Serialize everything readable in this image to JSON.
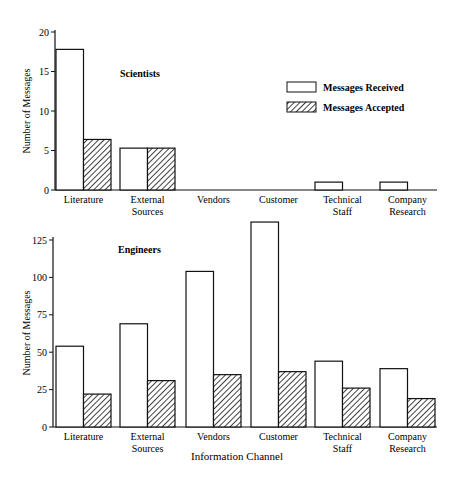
{
  "chart_data": [
    {
      "type": "bar",
      "title": "Scientists",
      "xlabel": "",
      "ylabel": "Number of Messages",
      "ylim": [
        0,
        20
      ],
      "yticks": [
        0,
        5,
        10,
        15,
        20
      ],
      "categories": [
        "Literature",
        "External Sources",
        "Vendors",
        "Customer",
        "Technical Staff",
        "Company Research"
      ],
      "series": [
        {
          "name": "Messages Received",
          "values": [
            17.8,
            5.3,
            0,
            0,
            1,
            1
          ]
        },
        {
          "name": "Messages Accepted",
          "values": [
            6.4,
            5.3,
            0,
            0,
            0,
            0
          ]
        }
      ],
      "legend_position": "upper right",
      "grid": false
    },
    {
      "type": "bar",
      "title": "Engineers",
      "xlabel": "Information Channel",
      "ylabel": "Number of Messages",
      "ylim": [
        0,
        125
      ],
      "yticks": [
        0,
        25,
        50,
        75,
        100,
        125
      ],
      "categories": [
        "Literature",
        "External Sources",
        "Vendors",
        "Customer",
        "Technical Staff",
        "Company Research"
      ],
      "series": [
        {
          "name": "Messages Received",
          "values": [
            54,
            69,
            104,
            137,
            44,
            39
          ]
        },
        {
          "name": "Messages Accepted",
          "values": [
            22,
            31,
            35,
            37,
            26,
            19
          ]
        }
      ],
      "grid": false
    }
  ],
  "labels": {
    "top_title": "Scientists",
    "bottom_title": "Engineers",
    "ylabel": "Number of Messages",
    "xlabel": "Information Channel",
    "legend_received": "Messages Received",
    "legend_accepted": "Messages Accepted",
    "top_ticks": [
      "20",
      "15",
      "10",
      "5",
      "0"
    ],
    "bottom_ticks": [
      "125",
      "100",
      "75",
      "50",
      "25",
      "0"
    ],
    "cat_lines": [
      [
        "Literature",
        ""
      ],
      [
        "External",
        "Sources"
      ],
      [
        "Vendors",
        ""
      ],
      [
        "Customer",
        ""
      ],
      [
        "Technical",
        "Staff"
      ],
      [
        "Company",
        "Research"
      ]
    ]
  }
}
